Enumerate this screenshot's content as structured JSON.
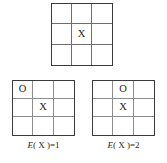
{
  "figure": {
    "type": "tic-tac-toe-diagram",
    "background_color": "#ffffff",
    "grid_border_color": "#3a3a3a",
    "grid_line_color": "#8d8d8d",
    "mark_color": "#262626"
  },
  "boards": [
    {
      "id": "board-top",
      "name": "initial-board",
      "rows": 3,
      "columns": 3,
      "cells": [
        [
          "",
          "",
          ""
        ],
        [
          "",
          "X",
          ""
        ],
        [
          "",
          "",
          ""
        ]
      ],
      "caption": ""
    },
    {
      "id": "board-left",
      "name": "board-option-1",
      "rows": 3,
      "columns": 3,
      "cells": [
        [
          "O",
          "",
          ""
        ],
        [
          "",
          "X",
          ""
        ],
        [
          "",
          "",
          ""
        ]
      ],
      "caption": "E( X )=1",
      "caption_parts": {
        "function": "E",
        "open": "( ",
        "variable": "X",
        "close": " )=",
        "value": "1"
      }
    },
    {
      "id": "board-right",
      "name": "board-option-2",
      "rows": 3,
      "columns": 3,
      "cells": [
        [
          "",
          "O",
          ""
        ],
        [
          "",
          "X",
          ""
        ],
        [
          "",
          "",
          ""
        ]
      ],
      "caption": "E( X )=2",
      "caption_parts": {
        "function": "E",
        "open": "( ",
        "variable": "X",
        "close": " )=",
        "value": "2"
      }
    }
  ],
  "page_caption_sliver": ""
}
